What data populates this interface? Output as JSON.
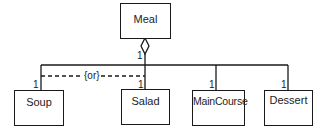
{
  "diagram": {
    "type": "UML class diagram (aggregation with {or} constraint)",
    "classes": [
      {
        "id": "meal",
        "name": "Meal"
      },
      {
        "id": "soup",
        "name": "Soup"
      },
      {
        "id": "salad",
        "name": "Salad"
      },
      {
        "id": "maincourse",
        "name": "MainCourse"
      },
      {
        "id": "dessert",
        "name": "Dessert"
      }
    ],
    "aggregation": {
      "whole": "Meal",
      "whole_multiplicity": "1",
      "parts": [
        {
          "name": "Soup",
          "multiplicity": "1"
        },
        {
          "name": "Salad",
          "multiplicity": "1"
        },
        {
          "name": "MainCourse",
          "multiplicity": "1"
        },
        {
          "name": "Dessert",
          "multiplicity": "1"
        }
      ]
    },
    "constraint": {
      "label": "{or}",
      "between": [
        "Soup",
        "Salad"
      ]
    },
    "colors": {
      "line": "#1a1a1a",
      "background": "#ffffff"
    }
  }
}
